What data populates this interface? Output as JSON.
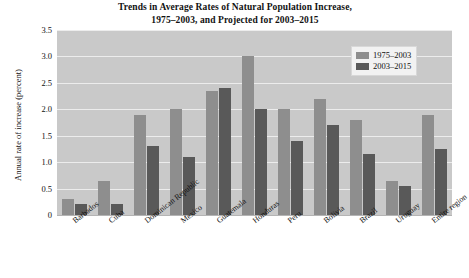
{
  "chart_data": {
    "type": "bar",
    "title": "Trends in Average Rates of Natural Population Increase, 1975–2003, and Projected for 2003–2015",
    "title_lines": [
      "Trends in Average Rates of Natural Population Increase,",
      "1975–2003, and Projected for 2003–2015"
    ],
    "xlabel": "",
    "ylabel": "Annual rate of increase (percent)",
    "ylim": [
      0,
      3.5
    ],
    "ytick_labels": [
      "0",
      "0.5",
      "1.0",
      "1.5",
      "2.0",
      "2.5",
      "3.0",
      "3.5"
    ],
    "ytick_values": [
      0,
      0.5,
      1.0,
      1.5,
      2.0,
      2.5,
      3.0,
      3.5
    ],
    "grid": true,
    "grid_axis": "y",
    "legend_position": "top-right",
    "categories": [
      "Barbados",
      "Cuba",
      "Dominican Republic",
      "Mexico",
      "Guatemala",
      "Honduras",
      "Peru",
      "Bolivia",
      "Brazil",
      "Uruguay",
      "Entire region"
    ],
    "series": [
      {
        "name": "1975–2003",
        "color": "#8e8e8e",
        "values": [
          0.3,
          0.65,
          1.9,
          2.0,
          2.35,
          3.0,
          2.0,
          2.2,
          1.8,
          0.65,
          1.9
        ]
      },
      {
        "name": "2003–2015",
        "color": "#595959",
        "values": [
          0.2,
          0.2,
          1.3,
          1.1,
          2.4,
          2.0,
          1.4,
          1.7,
          1.15,
          0.55,
          1.25
        ]
      }
    ],
    "plot_background": "#c9c9c9",
    "gridline_color": "#ececec"
  }
}
